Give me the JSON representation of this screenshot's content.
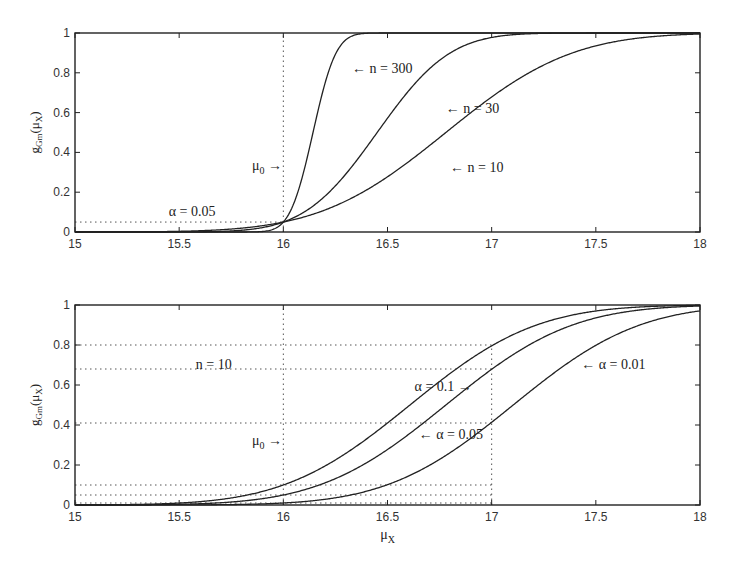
{
  "chart_data": [
    {
      "type": "line",
      "title": "",
      "xlabel": "",
      "ylabel": "g_Gm(μ_X)",
      "xlim": [
        15,
        18
      ],
      "ylim": [
        0,
        1
      ],
      "xticks": [
        "15",
        "15.5",
        "16",
        "16.5",
        "17",
        "17.5",
        "18"
      ],
      "yticks": [
        "0",
        "0.2",
        "0.4",
        "0.6",
        "0.8",
        "1"
      ],
      "grid": false,
      "model": {
        "mu0": 16,
        "sigma": 1.5,
        "alpha": 0.05
      },
      "series": [
        {
          "name": "n = 10",
          "n": 10,
          "x": [
            15,
            15.5,
            16,
            16.5,
            17,
            17.5,
            18
          ],
          "values": [
            0.0,
            0.004,
            0.05,
            0.24,
            0.68,
            0.95,
            1.0
          ]
        },
        {
          "name": "n = 30",
          "n": 30,
          "x": [
            15,
            15.5,
            16,
            16.5,
            17,
            17.5,
            18
          ],
          "values": [
            0.0,
            0.0,
            0.05,
            0.45,
            0.97,
            1.0,
            1.0
          ]
        },
        {
          "name": "n = 300",
          "n": 300,
          "x": [
            15,
            15.5,
            16,
            16.5,
            17,
            17.5,
            18
          ],
          "values": [
            0.0,
            0.0,
            0.05,
            1.0,
            1.0,
            1.0,
            1.0
          ]
        }
      ],
      "reference_lines": [
        {
          "type": "vertical",
          "x": 16,
          "style": "dotted"
        },
        {
          "type": "horizontal",
          "y": 0.05,
          "style": "dotted"
        }
      ],
      "annotations": [
        {
          "text": "← n = 300",
          "x": 16.33,
          "y": 0.8
        },
        {
          "text": "← n = 30",
          "x": 16.78,
          "y": 0.6
        },
        {
          "text": "← n = 10",
          "x": 16.8,
          "y": 0.3
        },
        {
          "text": "μ0 →",
          "x": 15.85,
          "y": 0.31
        },
        {
          "text": "α = 0.05",
          "x": 15.45,
          "y": 0.08
        }
      ]
    },
    {
      "type": "line",
      "title": "",
      "xlabel": "μ_X",
      "ylabel": "g_Gm(μ_X)",
      "xlim": [
        15,
        18
      ],
      "ylim": [
        0,
        1
      ],
      "xticks": [
        "15",
        "15.5",
        "16",
        "16.5",
        "17",
        "17.5",
        "18"
      ],
      "yticks": [
        "0",
        "0.2",
        "0.4",
        "0.6",
        "0.8",
        "1"
      ],
      "grid": false,
      "model": {
        "mu0": 16,
        "sigma": 1.5,
        "n": 10
      },
      "series": [
        {
          "name": "α = 0.1",
          "alpha": 0.1,
          "x": [
            15,
            15.5,
            16,
            16.5,
            17,
            17.5,
            18
          ],
          "values": [
            0.002,
            0.02,
            0.1,
            0.37,
            0.8,
            0.97,
            1.0
          ]
        },
        {
          "name": "α = 0.05",
          "alpha": 0.05,
          "x": [
            15,
            15.5,
            16,
            16.5,
            17,
            17.5,
            18
          ],
          "values": [
            0.0,
            0.008,
            0.05,
            0.24,
            0.68,
            0.95,
            1.0
          ]
        },
        {
          "name": "α = 0.01",
          "alpha": 0.01,
          "x": [
            15,
            15.5,
            16,
            16.5,
            17,
            17.5,
            18
          ],
          "values": [
            0.0,
            0.001,
            0.01,
            0.07,
            0.41,
            0.81,
            0.97
          ]
        }
      ],
      "reference_lines": [
        {
          "type": "vertical",
          "x": 16,
          "style": "dotted"
        },
        {
          "type": "vertical",
          "x": 17,
          "style": "dotted"
        },
        {
          "type": "horizontal",
          "y": 0.8,
          "style": "dotted"
        },
        {
          "type": "horizontal",
          "y": 0.68,
          "style": "dotted"
        },
        {
          "type": "horizontal",
          "y": 0.41,
          "style": "dotted"
        },
        {
          "type": "horizontal",
          "y": 0.1,
          "style": "dotted"
        },
        {
          "type": "horizontal",
          "y": 0.05,
          "style": "dotted"
        },
        {
          "type": "horizontal",
          "y": 0.01,
          "style": "dotted"
        }
      ],
      "annotations": [
        {
          "text": "n = 10",
          "x": 15.58,
          "y": 0.68
        },
        {
          "text": "α = 0.1 →",
          "x": 16.63,
          "y": 0.57
        },
        {
          "text": "← α = 0.05",
          "x": 16.65,
          "y": 0.33
        },
        {
          "text": "← α = 0.01",
          "x": 17.43,
          "y": 0.68
        },
        {
          "text": "μ0 →",
          "x": 15.85,
          "y": 0.3
        }
      ]
    }
  ],
  "labels": {
    "ylabel_main": "g",
    "ylabel_sub": "Gm",
    "ylabel_arg": "(μ",
    "ylabel_arg_sub": "X",
    "ylabel_close": ")",
    "xlabel_main": "μ",
    "xlabel_sub": "X"
  }
}
